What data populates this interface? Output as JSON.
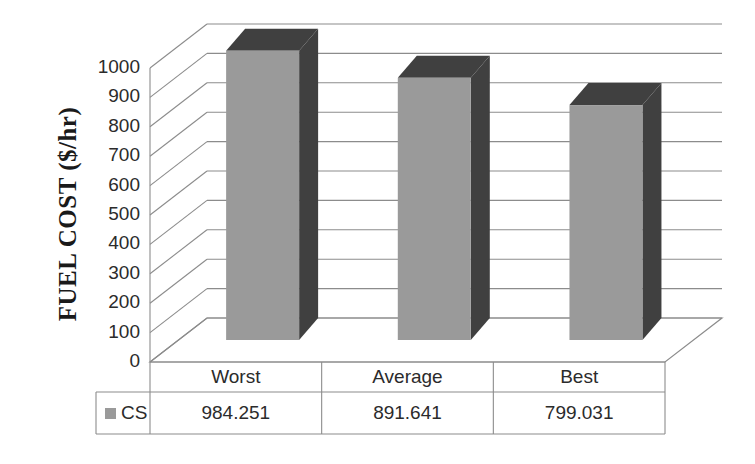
{
  "chart_data": {
    "type": "bar",
    "title": "",
    "xlabel": "",
    "ylabel": "FUEL COST ($/hr)",
    "categories": [
      "Worst",
      "Average",
      "Best"
    ],
    "series": [
      {
        "name": "CS",
        "values": [
          984.251,
          891.641,
          799.031
        ],
        "value_labels": [
          "984.251",
          "891.641",
          "799.031"
        ],
        "front_color": "#9a9a9a",
        "shade_color": "#404040"
      }
    ],
    "ylim": [
      0,
      1000
    ],
    "ytick_labels": [
      "1000",
      "900",
      "800",
      "700",
      "600",
      "500",
      "400",
      "300",
      "200",
      "100",
      "0"
    ],
    "ytick_values": [
      1000,
      900,
      800,
      700,
      600,
      500,
      400,
      300,
      200,
      100,
      0
    ],
    "grid": true,
    "grid_axis": "y",
    "legend_position": "data-table",
    "three_d": true,
    "data_table_visible": true
  },
  "axis": {
    "y_title": "FUEL COST ($/hr)",
    "ticks": [
      "1000",
      "900",
      "800",
      "700",
      "600",
      "500",
      "400",
      "300",
      "200",
      "100",
      "0"
    ]
  },
  "data_table": {
    "legend_label": "CS",
    "headers": [
      "Worst",
      "Average",
      "Best"
    ],
    "values": [
      "984.251",
      "891.641",
      "799.031"
    ]
  },
  "colors": {
    "bar_front": "#9a9a9a",
    "bar_shade": "#404040",
    "grid_line": "#8c8c8c",
    "table_line": "#8c8c8c",
    "text": "#2b2b2b",
    "background": "#ffffff"
  }
}
